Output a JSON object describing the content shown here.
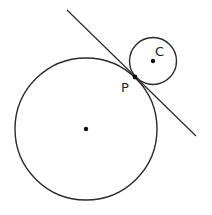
{
  "diagram": {
    "colors": {
      "stroke": "#2a2a2a",
      "background": "#ffffff"
    },
    "large_circle": {
      "cx": 86,
      "cy": 129,
      "r": 71,
      "center_dot": true
    },
    "small_circle": {
      "cx": 153,
      "cy": 61,
      "r": 23.5,
      "center_label": "C"
    },
    "tangent_point": {
      "x": 135,
      "y": 77,
      "label": "P"
    },
    "tangent_line": {
      "x1": 67,
      "y1": 10,
      "x2": 196,
      "y2": 136
    },
    "labels": {
      "point_p": "P",
      "point_c": "C"
    }
  }
}
